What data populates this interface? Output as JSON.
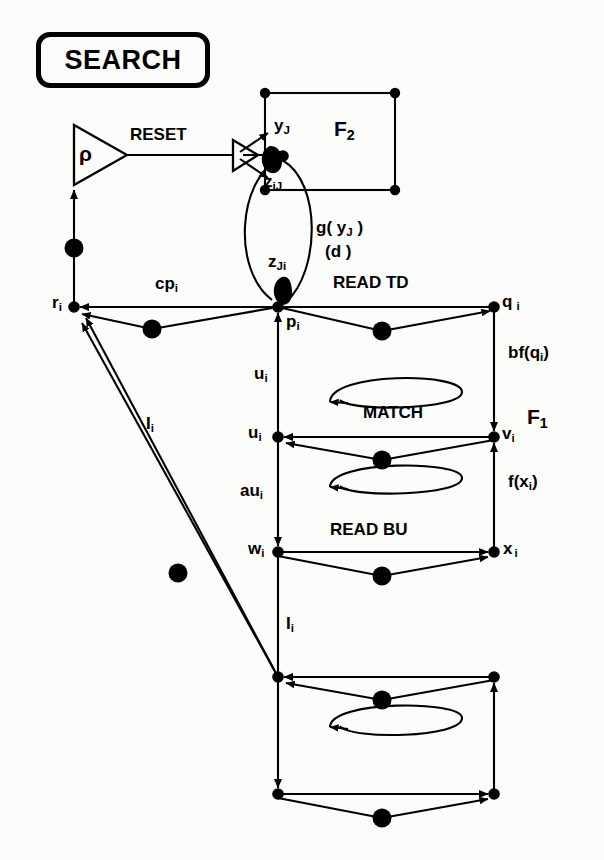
{
  "figure": {
    "title": "SEARCH",
    "line_color": "#000000",
    "background_color": "#fcfcfa"
  },
  "title_box": {
    "label": "SEARCH"
  },
  "fields": {
    "f2_label": "F",
    "f2_sub": "2",
    "f1_label": "F",
    "f1_sub": "1"
  },
  "vigilance": {
    "symbol": "ρ",
    "reset_label": "RESET"
  },
  "process_labels": {
    "read_td": "READ  TD",
    "match": "MATCH",
    "read_bu": "READ  BU"
  },
  "nodes": [
    {
      "name": "r",
      "sub": "i"
    },
    {
      "name": "p",
      "sub": "i"
    },
    {
      "name": "q",
      "sub": "i"
    },
    {
      "name": "u",
      "sub": "i"
    },
    {
      "name": "v",
      "sub": "i"
    },
    {
      "name": "w",
      "sub": "i"
    },
    {
      "name": "x",
      "sub": "i"
    }
  ],
  "signal_labels": {
    "y_J": {
      "base": "y",
      "sub": "J"
    },
    "z_iJ": {
      "base": "z",
      "sub": "iJ"
    },
    "z_Ji": {
      "base": "z",
      "sub": "Ji"
    },
    "g_yJ": "g( y",
    "g_yJ_sub": "J",
    "g_yJ_end": " )",
    "d_term": "(d )",
    "cp_i": {
      "base": "cp",
      "sub": "i"
    },
    "u_i_upper": {
      "base": "u",
      "sub": "i"
    },
    "u_i_node": {
      "base": "u",
      "sub": "i"
    },
    "au_i": {
      "base": "au",
      "sub": "i"
    },
    "bf_qi": "bf(q",
    "bf_qi_sub": "i",
    "bf_qi_end": ")",
    "f_xi": "f(x",
    "f_xi_sub": "i",
    "f_xi_end": ")",
    "I_i_upper": {
      "base": "I",
      "sub": "i"
    },
    "I_i_lower": {
      "base": "I",
      "sub": "i"
    }
  },
  "geometry": {
    "left_col_x": 74,
    "center_col_x": 278,
    "right_col_x": 494,
    "row_read_td_y": 307,
    "row_match_y": 437,
    "row_read_bu_y": 552,
    "row_b1_y": 677,
    "row_b2_y": 794,
    "f2_box": {
      "x1": 265,
      "y1": 93,
      "x2": 395,
      "y2": 190
    }
  }
}
